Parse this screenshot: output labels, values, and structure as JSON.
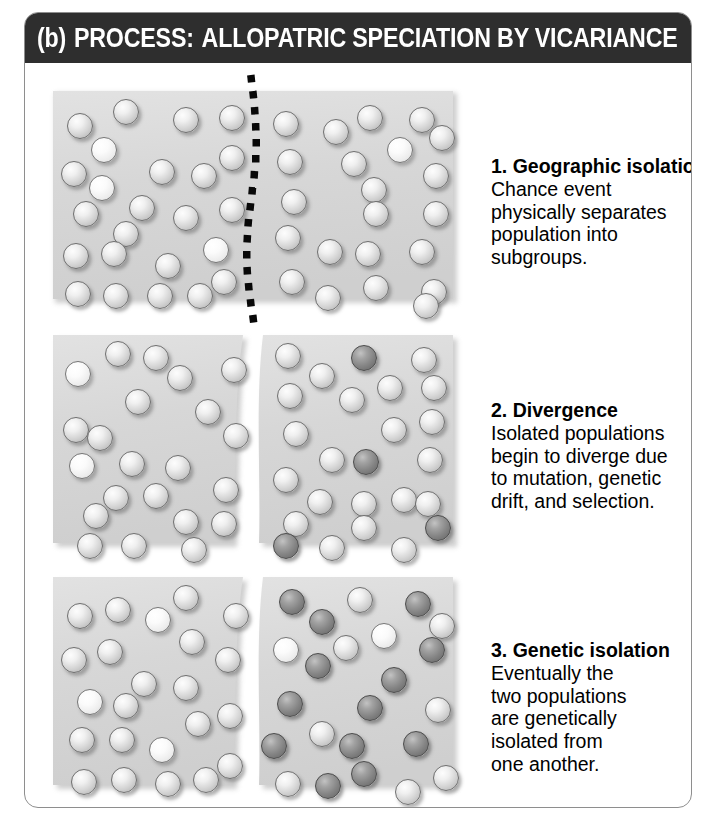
{
  "header": {
    "label": "(b)",
    "process_word": "PROCESS:",
    "title": "ALLOPATRIC SPECIATION BY VICARIANCE",
    "background_color": "#2e2e2e",
    "text_color": "#ffffff"
  },
  "card": {
    "border_color": "#8e8e8e",
    "background_color": "#ffffff"
  },
  "palette": {
    "habitat_fill": "#d8d8d8",
    "sphere_light": "#d2d2d2",
    "sphere_pale": "#f4f4f4",
    "sphere_dark": "#848484",
    "divider_color": "#000000"
  },
  "stages": [
    {
      "id": "stage-1",
      "number": "1.",
      "title": "1. Geographic isolation",
      "body": "Chance event\nphysically separates\npopulation into\nsubgroups.",
      "habitat_state": "single-continuous",
      "divider": "dotted-line",
      "left_population": "light",
      "right_population": "light"
    },
    {
      "id": "stage-2",
      "number": "2.",
      "title": "2. Divergence",
      "body": "Isolated populations\nbegin to diverge due\nto mutation, genetic\ndrift, and selection.",
      "habitat_state": "split-two-regions",
      "divider": "wavy-gap",
      "left_population": "light",
      "right_population": "light-with-few-dark"
    },
    {
      "id": "stage-3",
      "number": "3.",
      "title": "3. Genetic isolation",
      "body": "Eventually the\ntwo populations\nare genetically\nisolated from\none another.",
      "habitat_state": "split-two-regions",
      "divider": "wavy-gap",
      "left_population": "light",
      "right_population": "mostly-dark"
    }
  ],
  "chart_data": {
    "type": "diagram",
    "panels": [
      {
        "stage": 1,
        "spheres": [
          {
            "x": 16,
            "y": 24,
            "tone": "light"
          },
          {
            "x": 62,
            "y": 10,
            "tone": "light"
          },
          {
            "x": 122,
            "y": 18,
            "tone": "light"
          },
          {
            "x": 168,
            "y": 16,
            "tone": "light"
          },
          {
            "x": 40,
            "y": 48,
            "tone": "pale"
          },
          {
            "x": 10,
            "y": 72,
            "tone": "light"
          },
          {
            "x": 38,
            "y": 86,
            "tone": "pale"
          },
          {
            "x": 98,
            "y": 70,
            "tone": "light"
          },
          {
            "x": 140,
            "y": 74,
            "tone": "light"
          },
          {
            "x": 168,
            "y": 56,
            "tone": "light"
          },
          {
            "x": 22,
            "y": 112,
            "tone": "light"
          },
          {
            "x": 78,
            "y": 106,
            "tone": "light"
          },
          {
            "x": 122,
            "y": 116,
            "tone": "light"
          },
          {
            "x": 168,
            "y": 108,
            "tone": "light"
          },
          {
            "x": 62,
            "y": 132,
            "tone": "light"
          },
          {
            "x": 12,
            "y": 154,
            "tone": "light"
          },
          {
            "x": 50,
            "y": 152,
            "tone": "light"
          },
          {
            "x": 104,
            "y": 164,
            "tone": "light"
          },
          {
            "x": 152,
            "y": 148,
            "tone": "pale"
          },
          {
            "x": 14,
            "y": 192,
            "tone": "light"
          },
          {
            "x": 52,
            "y": 194,
            "tone": "light"
          },
          {
            "x": 96,
            "y": 194,
            "tone": "light"
          },
          {
            "x": 136,
            "y": 194,
            "tone": "light"
          },
          {
            "x": 160,
            "y": 180,
            "tone": "light"
          },
          {
            "x": 222,
            "y": 22,
            "tone": "light"
          },
          {
            "x": 272,
            "y": 30,
            "tone": "light"
          },
          {
            "x": 306,
            "y": 16,
            "tone": "light"
          },
          {
            "x": 358,
            "y": 18,
            "tone": "light"
          },
          {
            "x": 378,
            "y": 36,
            "tone": "light"
          },
          {
            "x": 226,
            "y": 60,
            "tone": "light"
          },
          {
            "x": 290,
            "y": 62,
            "tone": "light"
          },
          {
            "x": 336,
            "y": 48,
            "tone": "pale"
          },
          {
            "x": 372,
            "y": 74,
            "tone": "light"
          },
          {
            "x": 230,
            "y": 100,
            "tone": "light"
          },
          {
            "x": 310,
            "y": 88,
            "tone": "light"
          },
          {
            "x": 312,
            "y": 112,
            "tone": "light"
          },
          {
            "x": 372,
            "y": 112,
            "tone": "light"
          },
          {
            "x": 224,
            "y": 136,
            "tone": "light"
          },
          {
            "x": 266,
            "y": 150,
            "tone": "light"
          },
          {
            "x": 304,
            "y": 152,
            "tone": "light"
          },
          {
            "x": 358,
            "y": 150,
            "tone": "light"
          },
          {
            "x": 228,
            "y": 180,
            "tone": "light"
          },
          {
            "x": 264,
            "y": 196,
            "tone": "light"
          },
          {
            "x": 312,
            "y": 186,
            "tone": "light"
          },
          {
            "x": 370,
            "y": 190,
            "tone": "light"
          },
          {
            "x": 362,
            "y": 204,
            "tone": "light"
          }
        ]
      },
      {
        "stage": 2,
        "spheres": [
          {
            "x": 14,
            "y": 28,
            "tone": "pale"
          },
          {
            "x": 54,
            "y": 8,
            "tone": "light"
          },
          {
            "x": 92,
            "y": 12,
            "tone": "light"
          },
          {
            "x": 116,
            "y": 32,
            "tone": "light"
          },
          {
            "x": 170,
            "y": 24,
            "tone": "light"
          },
          {
            "x": 74,
            "y": 56,
            "tone": "light"
          },
          {
            "x": 144,
            "y": 66,
            "tone": "light"
          },
          {
            "x": 12,
            "y": 84,
            "tone": "light"
          },
          {
            "x": 36,
            "y": 92,
            "tone": "light"
          },
          {
            "x": 172,
            "y": 90,
            "tone": "light"
          },
          {
            "x": 18,
            "y": 120,
            "tone": "pale"
          },
          {
            "x": 68,
            "y": 118,
            "tone": "light"
          },
          {
            "x": 114,
            "y": 122,
            "tone": "light"
          },
          {
            "x": 162,
            "y": 144,
            "tone": "light"
          },
          {
            "x": 52,
            "y": 152,
            "tone": "light"
          },
          {
            "x": 92,
            "y": 150,
            "tone": "light"
          },
          {
            "x": 32,
            "y": 170,
            "tone": "light"
          },
          {
            "x": 122,
            "y": 176,
            "tone": "light"
          },
          {
            "x": 160,
            "y": 178,
            "tone": "light"
          },
          {
            "x": 26,
            "y": 200,
            "tone": "light"
          },
          {
            "x": 70,
            "y": 200,
            "tone": "light"
          },
          {
            "x": 130,
            "y": 204,
            "tone": "light"
          },
          {
            "x": 224,
            "y": 10,
            "tone": "light"
          },
          {
            "x": 258,
            "y": 30,
            "tone": "light"
          },
          {
            "x": 300,
            "y": 12,
            "tone": "dark"
          },
          {
            "x": 360,
            "y": 14,
            "tone": "light"
          },
          {
            "x": 226,
            "y": 50,
            "tone": "light"
          },
          {
            "x": 288,
            "y": 54,
            "tone": "light"
          },
          {
            "x": 326,
            "y": 42,
            "tone": "light"
          },
          {
            "x": 370,
            "y": 42,
            "tone": "light"
          },
          {
            "x": 232,
            "y": 88,
            "tone": "light"
          },
          {
            "x": 330,
            "y": 84,
            "tone": "light"
          },
          {
            "x": 368,
            "y": 76,
            "tone": "light"
          },
          {
            "x": 268,
            "y": 114,
            "tone": "light"
          },
          {
            "x": 302,
            "y": 116,
            "tone": "dark"
          },
          {
            "x": 366,
            "y": 114,
            "tone": "light"
          },
          {
            "x": 222,
            "y": 134,
            "tone": "light"
          },
          {
            "x": 256,
            "y": 156,
            "tone": "light"
          },
          {
            "x": 300,
            "y": 158,
            "tone": "light"
          },
          {
            "x": 340,
            "y": 154,
            "tone": "light"
          },
          {
            "x": 364,
            "y": 158,
            "tone": "light"
          },
          {
            "x": 232,
            "y": 178,
            "tone": "light"
          },
          {
            "x": 300,
            "y": 182,
            "tone": "light"
          },
          {
            "x": 374,
            "y": 182,
            "tone": "dark"
          },
          {
            "x": 222,
            "y": 200,
            "tone": "dark"
          },
          {
            "x": 268,
            "y": 202,
            "tone": "light"
          },
          {
            "x": 340,
            "y": 204,
            "tone": "light"
          }
        ]
      },
      {
        "stage": 3,
        "spheres": [
          {
            "x": 16,
            "y": 28,
            "tone": "light"
          },
          {
            "x": 54,
            "y": 22,
            "tone": "light"
          },
          {
            "x": 94,
            "y": 32,
            "tone": "pale"
          },
          {
            "x": 122,
            "y": 10,
            "tone": "light"
          },
          {
            "x": 172,
            "y": 28,
            "tone": "light"
          },
          {
            "x": 128,
            "y": 54,
            "tone": "light"
          },
          {
            "x": 10,
            "y": 72,
            "tone": "light"
          },
          {
            "x": 46,
            "y": 64,
            "tone": "light"
          },
          {
            "x": 164,
            "y": 72,
            "tone": "light"
          },
          {
            "x": 80,
            "y": 96,
            "tone": "light"
          },
          {
            "x": 122,
            "y": 100,
            "tone": "light"
          },
          {
            "x": 26,
            "y": 114,
            "tone": "pale"
          },
          {
            "x": 62,
            "y": 118,
            "tone": "light"
          },
          {
            "x": 134,
            "y": 136,
            "tone": "light"
          },
          {
            "x": 166,
            "y": 128,
            "tone": "light"
          },
          {
            "x": 18,
            "y": 152,
            "tone": "light"
          },
          {
            "x": 58,
            "y": 152,
            "tone": "light"
          },
          {
            "x": 98,
            "y": 162,
            "tone": "pale"
          },
          {
            "x": 166,
            "y": 178,
            "tone": "light"
          },
          {
            "x": 20,
            "y": 194,
            "tone": "light"
          },
          {
            "x": 60,
            "y": 192,
            "tone": "light"
          },
          {
            "x": 104,
            "y": 196,
            "tone": "light"
          },
          {
            "x": 142,
            "y": 192,
            "tone": "light"
          },
          {
            "x": 228,
            "y": 14,
            "tone": "dark"
          },
          {
            "x": 296,
            "y": 12,
            "tone": "light"
          },
          {
            "x": 354,
            "y": 16,
            "tone": "dark"
          },
          {
            "x": 258,
            "y": 34,
            "tone": "dark"
          },
          {
            "x": 378,
            "y": 38,
            "tone": "light"
          },
          {
            "x": 222,
            "y": 62,
            "tone": "pale"
          },
          {
            "x": 282,
            "y": 60,
            "tone": "light"
          },
          {
            "x": 320,
            "y": 48,
            "tone": "pale"
          },
          {
            "x": 368,
            "y": 62,
            "tone": "dark"
          },
          {
            "x": 254,
            "y": 78,
            "tone": "dark"
          },
          {
            "x": 330,
            "y": 92,
            "tone": "dark"
          },
          {
            "x": 226,
            "y": 116,
            "tone": "dark"
          },
          {
            "x": 306,
            "y": 120,
            "tone": "dark"
          },
          {
            "x": 374,
            "y": 122,
            "tone": "light"
          },
          {
            "x": 258,
            "y": 146,
            "tone": "light"
          },
          {
            "x": 210,
            "y": 158,
            "tone": "dark"
          },
          {
            "x": 288,
            "y": 158,
            "tone": "dark"
          },
          {
            "x": 352,
            "y": 156,
            "tone": "dark"
          },
          {
            "x": 300,
            "y": 186,
            "tone": "dark"
          },
          {
            "x": 224,
            "y": 196,
            "tone": "light"
          },
          {
            "x": 264,
            "y": 198,
            "tone": "dark"
          },
          {
            "x": 344,
            "y": 204,
            "tone": "light"
          },
          {
            "x": 382,
            "y": 190,
            "tone": "light"
          }
        ]
      }
    ]
  }
}
